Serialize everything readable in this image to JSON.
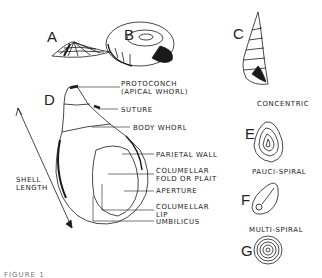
{
  "figure": {
    "caption_fragment": "FIGURE 1",
    "panels": {
      "A": {
        "letter": "A",
        "description": "limpet (conical) shell"
      },
      "B": {
        "letter": "B",
        "description": "planispiral shell"
      },
      "C": {
        "letter": "C",
        "description": "high-spired shell"
      },
      "D": {
        "letter": "D",
        "description": "snail shell anatomy"
      },
      "E": {
        "letter": "E",
        "title": "CONCENTRIC"
      },
      "F": {
        "letter": "F",
        "title": "PAUCI-SPIRAL"
      },
      "G": {
        "letter": "G",
        "title": "MULTI-SPIRAL"
      }
    },
    "anatomy_labels": {
      "protoconch": "PROTOCONCH\n(APICAL WHORL)",
      "suture": "SUTURE",
      "body_whorl": "BODY WHORL",
      "parietal_wall": "PARIETAL WALL",
      "columellar_fold": "COLUMELLAR\nFOLD OR PLAIT",
      "aperture": "APERTURE",
      "columellar_lip": "COLUMELLAR\nLIP",
      "umbilicus": "UMBILICUS",
      "shell_length": "SHELL\nLENGTH"
    },
    "line_color": "#1a1a1a"
  }
}
